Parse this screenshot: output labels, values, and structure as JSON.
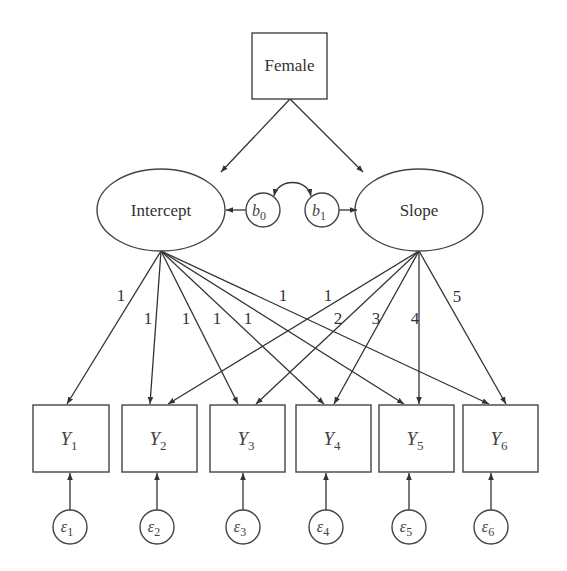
{
  "diagram": {
    "type": "latent growth curve model",
    "covariate": {
      "label": "Female"
    },
    "latent_factors": [
      {
        "id": "intercept",
        "label": "Intercept"
      },
      {
        "id": "slope",
        "label": "Slope"
      }
    ],
    "means": [
      {
        "id": "b0",
        "base": "b",
        "sub": "0",
        "target": "Intercept"
      },
      {
        "id": "b1",
        "base": "b",
        "sub": "1",
        "target": "Slope"
      }
    ],
    "observed": [
      {
        "id": "Y1",
        "base": "Y",
        "sub": "1"
      },
      {
        "id": "Y2",
        "base": "Y",
        "sub": "2"
      },
      {
        "id": "Y3",
        "base": "Y",
        "sub": "3"
      },
      {
        "id": "Y4",
        "base": "Y",
        "sub": "4"
      },
      {
        "id": "Y5",
        "base": "Y",
        "sub": "5"
      },
      {
        "id": "Y6",
        "base": "Y",
        "sub": "6"
      }
    ],
    "errors": [
      {
        "id": "e1",
        "base": "ε",
        "sub": "1"
      },
      {
        "id": "e2",
        "base": "ε",
        "sub": "2"
      },
      {
        "id": "e3",
        "base": "ε",
        "sub": "3"
      },
      {
        "id": "e4",
        "base": "ε",
        "sub": "4"
      },
      {
        "id": "e5",
        "base": "ε",
        "sub": "5"
      },
      {
        "id": "e6",
        "base": "ε",
        "sub": "6"
      }
    ],
    "intercept_loadings": [
      "1",
      "1",
      "1",
      "1",
      "1",
      "1"
    ],
    "slope_loadings": [
      "1",
      "2",
      "3",
      "4",
      "5"
    ],
    "edges": [
      {
        "from": "Female",
        "to": "Intercept"
      },
      {
        "from": "Female",
        "to": "Slope"
      },
      {
        "from": "b0",
        "to": "Intercept"
      },
      {
        "from": "b1",
        "to": "Slope"
      },
      {
        "from": "b0",
        "to": "b1",
        "type": "covariance"
      },
      {
        "from": "Intercept",
        "to": "Y1",
        "label": "1"
      },
      {
        "from": "Intercept",
        "to": "Y2",
        "label": "1"
      },
      {
        "from": "Intercept",
        "to": "Y3",
        "label": "1"
      },
      {
        "from": "Intercept",
        "to": "Y4",
        "label": "1"
      },
      {
        "from": "Intercept",
        "to": "Y5",
        "label": "1"
      },
      {
        "from": "Intercept",
        "to": "Y6",
        "label": "1"
      },
      {
        "from": "Slope",
        "to": "Y2",
        "label": "1"
      },
      {
        "from": "Slope",
        "to": "Y3",
        "label": "2"
      },
      {
        "from": "Slope",
        "to": "Y4",
        "label": "3"
      },
      {
        "from": "Slope",
        "to": "Y5",
        "label": "4"
      },
      {
        "from": "Slope",
        "to": "Y6",
        "label": "5"
      },
      {
        "from": "ε1",
        "to": "Y1"
      },
      {
        "from": "ε2",
        "to": "Y2"
      },
      {
        "from": "ε3",
        "to": "Y3"
      },
      {
        "from": "ε4",
        "to": "Y4"
      },
      {
        "from": "ε5",
        "to": "Y5"
      },
      {
        "from": "ε6",
        "to": "Y6"
      }
    ]
  }
}
